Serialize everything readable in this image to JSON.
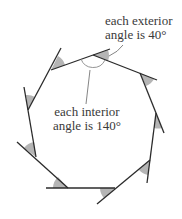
{
  "diagram": {
    "shape": "regular nonagon",
    "sides": 9,
    "colors": {
      "line": "#2b2b2b",
      "shade": "#b5b5b5",
      "leader": "#777777",
      "text": "#3a3a3a"
    },
    "labels": {
      "exterior": {
        "line1": "each exterior",
        "line2": "angle is 40°"
      },
      "interior": {
        "line1": "each interior",
        "line2": "angle is 140°"
      }
    },
    "exterior_angle_deg": 40,
    "interior_angle_deg": 140
  }
}
